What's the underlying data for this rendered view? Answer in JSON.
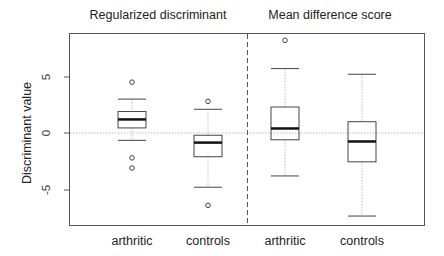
{
  "chart_data": {
    "type": "box",
    "panels": [
      {
        "title": "Regularized discriminant",
        "groups": [
          "arthritic",
          "controls"
        ]
      },
      {
        "title": "Mean difference score",
        "groups": [
          "arthritic",
          "controls"
        ]
      }
    ],
    "ylabel": "Discriminant value",
    "xlabel": "",
    "ylim": [
      -8.2,
      8.8
    ],
    "yticks": [
      -5,
      0,
      5
    ],
    "ytick_labels": [
      "-5",
      "0",
      "5"
    ],
    "reference_line": {
      "y": 0,
      "style": "dotted",
      "color": "#bbbbbb"
    },
    "divider": {
      "between_panels": true,
      "style": "dashed"
    },
    "grid": false,
    "boxes": [
      {
        "panel": "Regularized discriminant",
        "group": "arthritic",
        "whisker_low": -0.65,
        "q1": 0.45,
        "median": 1.2,
        "q3": 1.9,
        "whisker_high": 3.0,
        "outliers": [
          4.5,
          -2.2,
          -3.1
        ]
      },
      {
        "panel": "Regularized discriminant",
        "group": "controls",
        "whisker_low": -4.8,
        "q1": -2.1,
        "median": -0.85,
        "q3": -0.2,
        "whisker_high": 2.1,
        "outliers": [
          2.8,
          -6.4
        ]
      },
      {
        "panel": "Mean difference score",
        "group": "arthritic",
        "whisker_low": -3.8,
        "q1": -0.6,
        "median": 0.4,
        "q3": 2.3,
        "whisker_high": 5.7,
        "outliers": [
          8.2
        ]
      },
      {
        "panel": "Mean difference score",
        "group": "controls",
        "whisker_low": -7.35,
        "q1": -2.55,
        "median": -0.75,
        "q3": 1.0,
        "whisker_high": 5.2,
        "outliers": []
      }
    ]
  },
  "titles": {
    "left": "Regularized discriminant",
    "right": "Mean difference score"
  },
  "axis": {
    "ylabel": "Discriminant value",
    "y5": "5",
    "y0": "0",
    "yneg5": "-5"
  },
  "xticks": [
    "arthritic",
    "controls",
    "arthritic",
    "controls"
  ],
  "colors": {
    "box": "#444444",
    "median": "#111111",
    "whisker": "#bbbbbb",
    "frame": "#555555",
    "zero_line": "#bbbbbb"
  }
}
